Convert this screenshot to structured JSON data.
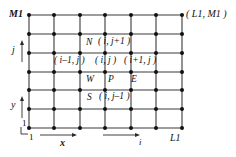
{
  "diagram": {
    "grid": {
      "type": "rectangular-mesh",
      "node_columns": 7,
      "node_rows": 7,
      "x_first": 29,
      "x_last": 182,
      "y_first": 15,
      "y_last": 128,
      "line_color": "#3a3a3a",
      "node_color": "#111111",
      "node_radius": 2.0,
      "line_width": 1.1
    },
    "corner_labels": {
      "top_left": "M1",
      "top_right": "( L1, M1 )",
      "bottom_left_vertical": "1",
      "bottom_left_horizontal": "1",
      "bottom_right": "L1"
    },
    "axis_labels": {
      "vertical_index": "j",
      "vertical_coordinate": "y",
      "horizontal_coordinate": "x",
      "horizontal_index": "i"
    },
    "stencil_labels": {
      "north": "N",
      "north_index": "( i, j+1 )",
      "west_index": "( i–1, j )",
      "center_index": "( i, j )",
      "east_index": "( i+1, j )",
      "west": "W",
      "center": "P",
      "east": "E",
      "south": "S",
      "south_index": "( i, j–1 )"
    }
  }
}
